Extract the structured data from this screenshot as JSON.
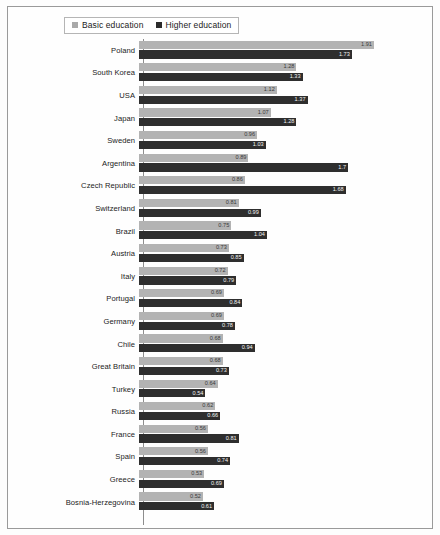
{
  "legend": {
    "items": [
      {
        "label": "Basic education",
        "color": "#a9a9a9",
        "icon": "square-swatch"
      },
      {
        "label": "Higher education",
        "color": "#2b2b2b",
        "icon": "square-swatch"
      }
    ]
  },
  "chart_data": {
    "type": "bar",
    "orientation": "horizontal",
    "title": "",
    "xlabel": "",
    "ylabel": "",
    "xlim": [
      0,
      2.0
    ],
    "grid": false,
    "legend_position": "top-left",
    "categories": [
      "Poland",
      "South Korea",
      "USA",
      "Japan",
      "Sweden",
      "Argentina",
      "Czech Republic",
      "Switzerland",
      "Brazil",
      "Austria",
      "Italy",
      "Portugal",
      "Germany",
      "Chile",
      "Great Britain",
      "Turkey",
      "Russia",
      "France",
      "Spain",
      "Greece",
      "Bosnia-Herzegovina"
    ],
    "series": [
      {
        "name": "Basic education",
        "color": "#b3b3b3",
        "values": [
          1.91,
          1.28,
          1.12,
          1.07,
          0.96,
          0.89,
          0.86,
          0.81,
          0.75,
          0.73,
          0.72,
          0.69,
          0.69,
          0.68,
          0.68,
          0.64,
          0.62,
          0.56,
          0.56,
          0.53,
          0.52
        ]
      },
      {
        "name": "Higher education",
        "color": "#2e2e2e",
        "values": [
          1.73,
          1.33,
          1.37,
          1.28,
          1.03,
          1.7,
          1.68,
          0.99,
          1.04,
          0.85,
          0.79,
          0.84,
          0.78,
          0.94,
          0.73,
          0.54,
          0.66,
          0.81,
          0.74,
          0.69,
          0.61
        ]
      }
    ],
    "value_labels": {
      "Poland": {
        "basic": "1.91",
        "higher": "1.73"
      },
      "South Korea": {
        "basic": "1.28",
        "higher": "1.33"
      },
      "USA": {
        "basic": "1.12",
        "higher": "1.37"
      },
      "Japan": {
        "basic": "1.07",
        "higher": "1.28"
      },
      "Sweden": {
        "basic": "0.96",
        "higher": "1.03"
      },
      "Argentina": {
        "basic": "0.89",
        "higher": "1.7"
      },
      "Czech Republic": {
        "basic": "0.86",
        "higher": "1.68"
      },
      "Switzerland": {
        "basic": "0.81",
        "higher": "0.99"
      },
      "Brazil": {
        "basic": "0.75",
        "higher": "1.04"
      },
      "Austria": {
        "basic": "0.73",
        "higher": "0.85"
      },
      "Italy": {
        "basic": "0.72",
        "higher": "0.79"
      },
      "Portugal": {
        "basic": "0.69",
        "higher": "0.84"
      },
      "Germany": {
        "basic": "0.69",
        "higher": "0.78"
      },
      "Chile": {
        "basic": "0.68",
        "higher": "0.94"
      },
      "Great Britain": {
        "basic": "0.68",
        "higher": "0.73"
      },
      "Turkey": {
        "basic": "0.64",
        "higher": "0.54"
      },
      "Russia": {
        "basic": "0.62",
        "higher": "0.66"
      },
      "France": {
        "basic": "0.56",
        "higher": "0.81"
      },
      "Spain": {
        "basic": "0.56",
        "higher": "0.74"
      },
      "Greece": {
        "basic": "0.53",
        "higher": "0.69"
      },
      "Bosnia-Herzegovina": {
        "basic": "0.52",
        "higher": "0.61"
      }
    }
  }
}
